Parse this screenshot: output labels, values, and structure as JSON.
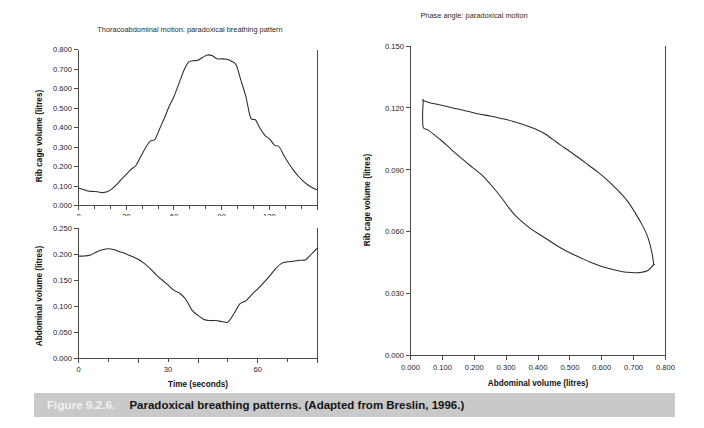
{
  "figure": {
    "number_label": "Figure 9.2.6.",
    "caption": "Paradoxical breathing patterns. (Adapted from Breslin, 1996.)",
    "caption_bar_color": "#c9c9c9",
    "caption_number_color": "#f2f2f2",
    "caption_text_color": "#141414"
  },
  "chart_data": [
    {
      "id": "rib-cage-timeseries",
      "type": "line",
      "title": "Thoracoabdominal motion: paradoxical breathing pattern",
      "xlabel": "",
      "ylabel": "Rib cage volume (litres)",
      "xlim": [
        0,
        150
      ],
      "ylim": [
        0.0,
        0.8
      ],
      "grid": false,
      "legend": "none",
      "xticks": [
        0,
        30,
        60,
        90,
        120
      ],
      "xtick_labels": [
        "0",
        "30",
        "60",
        "90",
        "120"
      ],
      "xminor_step": 10,
      "yticks": [
        0.0,
        0.1,
        0.2,
        0.3,
        0.4,
        0.5,
        0.6,
        0.7,
        0.8
      ],
      "ytick_labels": [
        "0.000",
        "0.100",
        "0.200",
        "0.300",
        "0.400",
        "0.500",
        "0.600",
        "0.700",
        "0.800"
      ],
      "line_color": "#2a2a2a",
      "x": [
        0,
        3,
        6,
        9,
        12,
        15,
        18,
        21,
        24,
        27,
        30,
        33,
        36,
        39,
        42,
        45,
        48,
        51,
        54,
        57,
        60,
        63,
        66,
        69,
        72,
        75,
        78,
        81,
        84,
        87,
        90,
        93,
        96,
        99,
        102,
        105,
        108,
        111,
        114,
        117,
        120,
        123,
        126,
        129,
        132,
        135,
        138,
        141,
        144,
        147,
        150
      ],
      "y": [
        0.09,
        0.082,
        0.074,
        0.072,
        0.07,
        0.066,
        0.07,
        0.085,
        0.108,
        0.135,
        0.16,
        0.185,
        0.205,
        0.25,
        0.295,
        0.33,
        0.34,
        0.395,
        0.45,
        0.51,
        0.56,
        0.625,
        0.69,
        0.735,
        0.742,
        0.745,
        0.76,
        0.772,
        0.768,
        0.752,
        0.752,
        0.75,
        0.74,
        0.72,
        0.64,
        0.56,
        0.45,
        0.44,
        0.395,
        0.36,
        0.34,
        0.31,
        0.3,
        0.255,
        0.215,
        0.18,
        0.15,
        0.125,
        0.105,
        0.09,
        0.08
      ]
    },
    {
      "id": "abdominal-timeseries",
      "type": "line",
      "title": "",
      "xlabel": "Time (seconds)",
      "ylabel": "Abdominal volume (litres)",
      "xlim": [
        0,
        80
      ],
      "ylim": [
        0.0,
        0.25
      ],
      "grid": false,
      "legend": "none",
      "xticks": [
        0,
        30,
        60
      ],
      "xtick_labels": [
        "0",
        "30",
        "60"
      ],
      "xminor_step": 10,
      "yticks": [
        0.0,
        0.05,
        0.1,
        0.15,
        0.2,
        0.25
      ],
      "ytick_labels": [
        "0.000",
        "0.050",
        "0.100",
        "0.150",
        "0.200",
        "0.250"
      ],
      "line_color": "#2a2a2a",
      "x": [
        0,
        2,
        4,
        6,
        8,
        10,
        12,
        14,
        16,
        18,
        20,
        22,
        24,
        26,
        28,
        30,
        32,
        34,
        36,
        38,
        40,
        42,
        44,
        46,
        48,
        50,
        52,
        54,
        56,
        58,
        60,
        62,
        64,
        66,
        68,
        70,
        72,
        74,
        76,
        78,
        80
      ],
      "y": [
        0.196,
        0.196,
        0.198,
        0.204,
        0.208,
        0.21,
        0.208,
        0.204,
        0.2,
        0.195,
        0.19,
        0.182,
        0.172,
        0.16,
        0.15,
        0.14,
        0.13,
        0.124,
        0.112,
        0.092,
        0.082,
        0.074,
        0.072,
        0.072,
        0.07,
        0.069,
        0.085,
        0.104,
        0.11,
        0.122,
        0.133,
        0.145,
        0.158,
        0.172,
        0.182,
        0.185,
        0.186,
        0.188,
        0.189,
        0.2,
        0.212
      ]
    },
    {
      "id": "phase-angle-loop",
      "type": "line",
      "title": "Phase angle: paradoxical motion",
      "xlabel": "Abdominal volume (litres)",
      "ylabel": "Rib cage volume (litres)",
      "xlim": [
        0.0,
        0.8
      ],
      "ylim": [
        0.0,
        0.15
      ],
      "grid": false,
      "legend": "none",
      "xticks": [
        0.0,
        0.1,
        0.2,
        0.3,
        0.4,
        0.5,
        0.6,
        0.7,
        0.8
      ],
      "xtick_labels": [
        "0.000",
        "0.100",
        "0.200",
        "0.300",
        "0.400",
        "0.500",
        "0.600",
        "0.700",
        "0.800"
      ],
      "yticks": [
        0.0,
        0.03,
        0.06,
        0.09,
        0.12,
        0.15
      ],
      "ytick_labels": [
        "0.000",
        "0.030",
        "0.060",
        "0.090",
        "0.120",
        "0.150"
      ],
      "line_color": "#2a2a2a",
      "loop_upper_x": [
        0.04,
        0.06,
        0.09,
        0.13,
        0.175,
        0.215,
        0.25,
        0.285,
        0.32,
        0.355,
        0.39,
        0.42,
        0.445,
        0.47,
        0.5,
        0.53,
        0.56,
        0.59,
        0.62,
        0.65,
        0.68,
        0.705,
        0.728,
        0.745,
        0.757,
        0.763
      ],
      "loop_upper_y": [
        0.1235,
        0.1225,
        0.1215,
        0.12,
        0.1185,
        0.117,
        0.116,
        0.1148,
        0.1135,
        0.1118,
        0.1098,
        0.1075,
        0.1048,
        0.102,
        0.0988,
        0.0955,
        0.092,
        0.0885,
        0.0845,
        0.08,
        0.0748,
        0.069,
        0.0628,
        0.057,
        0.05,
        0.044
      ],
      "loop_lower_x": [
        0.763,
        0.745,
        0.72,
        0.695,
        0.665,
        0.635,
        0.6,
        0.565,
        0.53,
        0.495,
        0.462,
        0.432,
        0.405,
        0.38,
        0.355,
        0.33,
        0.31,
        0.292,
        0.272,
        0.25,
        0.225,
        0.195,
        0.165,
        0.13,
        0.098,
        0.072,
        0.052,
        0.04,
        0.038,
        0.04
      ],
      "loop_lower_y": [
        0.044,
        0.041,
        0.04,
        0.04,
        0.0404,
        0.0415,
        0.043,
        0.045,
        0.0475,
        0.05,
        0.0528,
        0.0558,
        0.0585,
        0.061,
        0.064,
        0.0675,
        0.0712,
        0.075,
        0.079,
        0.083,
        0.0872,
        0.091,
        0.0948,
        0.0995,
        0.104,
        0.1072,
        0.1095,
        0.1105,
        0.1165,
        0.1235
      ]
    }
  ]
}
